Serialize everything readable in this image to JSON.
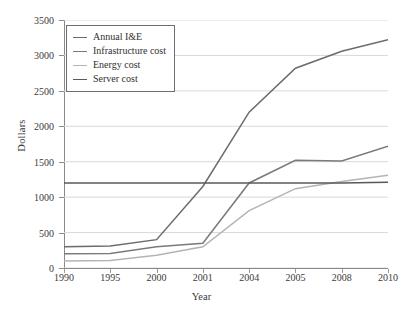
{
  "chart_data": {
    "type": "line",
    "title": "",
    "xlabel": "Year",
    "ylabel": "Dollars",
    "categories": [
      "1990",
      "1995",
      "2000",
      "2001",
      "2004",
      "2005",
      "2008",
      "2010"
    ],
    "ylim": [
      0,
      3500
    ],
    "yticks": [
      0,
      500,
      1000,
      1500,
      2000,
      2500,
      3000,
      3500
    ],
    "ytick_labels": [
      "0",
      "500",
      "1000",
      "1500",
      "2000",
      "2500",
      "3000",
      "3500"
    ],
    "grid": "horizontal",
    "legend_position": "upper-left",
    "series": [
      {
        "name": "Annual I&E",
        "color": "#6b6b6b",
        "values": [
          300,
          310,
          400,
          1150,
          2200,
          2820,
          3060,
          3220
        ]
      },
      {
        "name": "Infrastructure cost",
        "color": "#7a7a7a",
        "values": [
          200,
          205,
          300,
          350,
          1200,
          1520,
          1510,
          1720
        ]
      },
      {
        "name": "Energy cost",
        "color": "#b4b4b4",
        "values": [
          100,
          105,
          180,
          300,
          810,
          1120,
          1220,
          1310
        ]
      },
      {
        "name": "Server cost",
        "color": "#595959",
        "values": [
          1200,
          1200,
          1200,
          1200,
          1200,
          1200,
          1200,
          1210
        ]
      }
    ]
  },
  "legend": {
    "items": [
      {
        "label": "Annual I&E"
      },
      {
        "label": "Infrastructure cost"
      },
      {
        "label": "Energy cost"
      },
      {
        "label": "Server cost"
      }
    ]
  }
}
